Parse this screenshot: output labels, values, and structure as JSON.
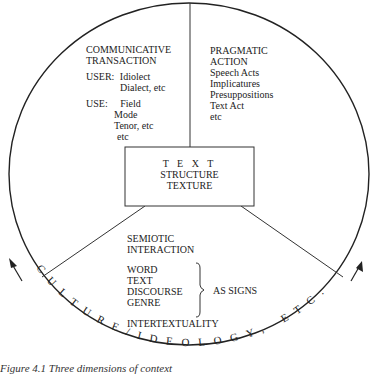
{
  "figure": {
    "caption": "Figure 4.1   Three dimensions of context",
    "center_box": {
      "lines": [
        "T E X T",
        "STRUCTURE",
        "TEXTURE"
      ]
    },
    "communicative_transaction": {
      "title_lines": [
        "COMMUNICATIVE",
        "TRANSACTION"
      ],
      "user_label": "USER:",
      "user_items": [
        "Idiolect",
        "Dialect, etc"
      ],
      "use_label": "USE:",
      "use_items": [
        "Field",
        "Mode",
        "Tenor, etc",
        "etc"
      ]
    },
    "pragmatic_action": {
      "title_lines": [
        "PRAGMATIC",
        "ACTION"
      ],
      "items": [
        "Speech Acts",
        "Implicatures",
        "Presuppositions",
        "Text Act",
        "etc"
      ]
    },
    "semiotic_interaction": {
      "title_lines": [
        "SEMIOTIC",
        "INTERACTION"
      ],
      "sign_items": [
        "WORD",
        "TEXT",
        "DISCOURSE",
        "GENRE"
      ],
      "brace_label": "AS SIGNS",
      "footer": "INTERTEXTUALITY"
    },
    "outer_ring_text": "CULTURE/IDEOLOGY, ETC.",
    "colors": {
      "line": "#222222",
      "text": "#222222",
      "background": "#ffffff"
    }
  }
}
